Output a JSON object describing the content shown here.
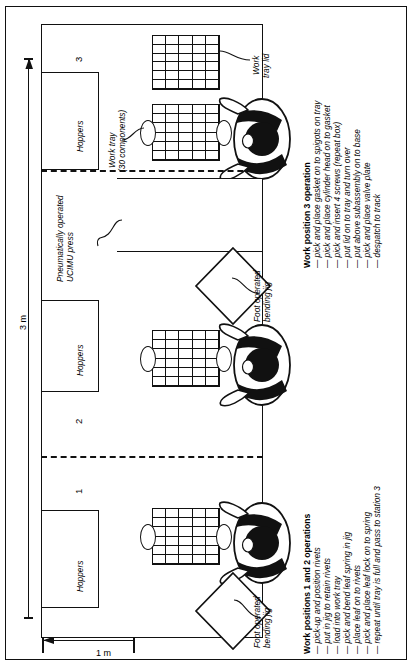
{
  "figure": {
    "dimensions": {
      "height_label": "3 m",
      "width_label": "1 m"
    },
    "stations": [
      "1",
      "2",
      "3"
    ],
    "hoppers_label": "Hoppers",
    "labels": {
      "work_tray": "Work tray",
      "work_tray_sub": "(30 components)",
      "work_tray_lid_l1": "Work",
      "work_tray_lid_l2": "tray lid",
      "press_l1": "Pneumatically operated",
      "press_l2": "UCIMU press",
      "bending_jig_l1": "Foot operated",
      "bending_jig_l2": "bending jig"
    },
    "ops_station3": {
      "title": "Work position 3 operation",
      "items": [
        "pick and place gasket on to spigots on tray",
        "pick and place cylinder head on to gasket",
        "pick and insert 4 screws (repeat box)",
        "put lid on to tray and turn over",
        "put above subassembly on to base",
        "pick and place valve plate",
        "despatch to track"
      ]
    },
    "ops_station12": {
      "title": "Work positions 1 and 2 operations",
      "items": [
        "pick-up and position rivets",
        "put in jig to retain rivets",
        "load into work tray",
        "pick and bend leaf spring in jig",
        "place leaf on to rivets",
        "pick and place leaf lock on to spring",
        "repeat until tray is full and pass to station 3"
      ]
    },
    "colors": {
      "ink": "#111111",
      "paper": "#ffffff"
    }
  }
}
